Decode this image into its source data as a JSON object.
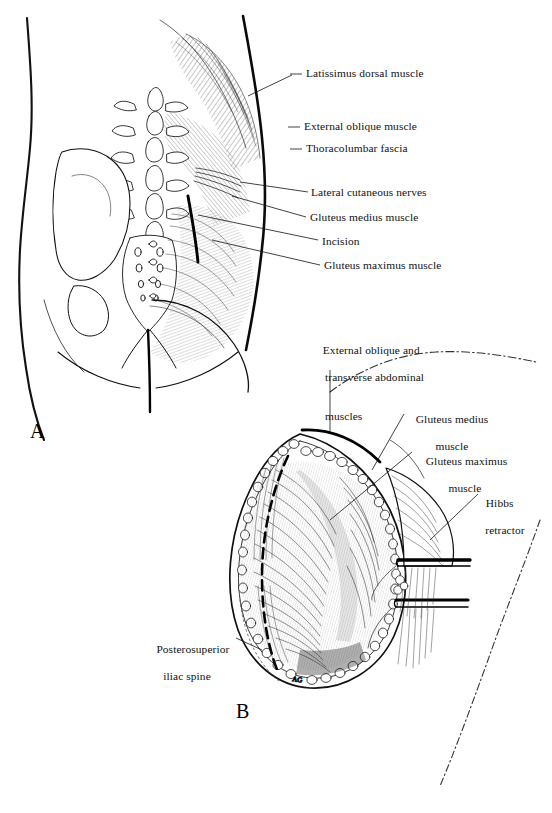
{
  "figure": {
    "panels": [
      {
        "letter": "A",
        "name": "surface-anatomy-panel"
      },
      {
        "letter": "B",
        "name": "open-wound-panel"
      }
    ],
    "caption": ""
  },
  "panel_a": {
    "letter": "A",
    "labels": [
      {
        "id": "latissimus",
        "text": "Latissimus dorsal muscle"
      },
      {
        "id": "external-oblique",
        "text": "External oblique muscle"
      },
      {
        "id": "thoracolumbar-fascia",
        "text": "Thoracolumbar fascia"
      },
      {
        "id": "lateral-cutaneous-nerves",
        "text": "Lateral cutaneous nerves"
      },
      {
        "id": "gluteus-medius",
        "text": "Gluteus medius muscle"
      },
      {
        "id": "incision",
        "text": "Incision"
      },
      {
        "id": "gluteus-maximus",
        "text": "Gluteus maximus muscle"
      }
    ]
  },
  "panel_b": {
    "letter": "B",
    "labels": [
      {
        "id": "external-oblique-transverse",
        "line1": "External oblique and",
        "line2": "transverse abdominal",
        "line3": "muscles"
      },
      {
        "id": "gluteus-medius",
        "line1": "Gluteus medius",
        "line2": "muscle"
      },
      {
        "id": "gluteus-maximus",
        "line1": "Gluteus maximus",
        "line2": "muscle"
      },
      {
        "id": "hibbs-retractor",
        "line1": "Hibbs",
        "line2": "retractor"
      },
      {
        "id": "posterosuperior-iliac-spine",
        "line1": "Posterosuperior",
        "line2": "iliac spine"
      }
    ],
    "signature": "AG"
  },
  "colors": {
    "ink": "#000000",
    "line": "#111111",
    "paper": "#ffffff",
    "hatch": "#2a2a2a",
    "faint": "#555555"
  }
}
